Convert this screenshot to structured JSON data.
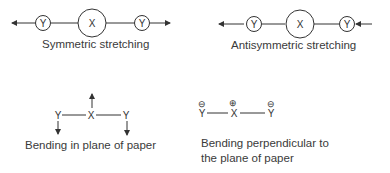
{
  "panels": {
    "symmetric": {
      "caption": "Symmetric stretching",
      "atoms": [
        "Y",
        "X",
        "Y"
      ]
    },
    "antisymmetric": {
      "caption": "Antisymmetric stretching",
      "atoms": [
        "Y",
        "X",
        "Y"
      ]
    },
    "bending_in_plane": {
      "caption": "Bending in plane of paper",
      "atoms": [
        "Y",
        "X",
        "Y"
      ]
    },
    "bending_perpendicular": {
      "caption_line1": "Bending perpendicular to",
      "caption_line2": "the plane of paper",
      "atoms": [
        "Y",
        "X",
        "Y"
      ],
      "charges": [
        "⊖",
        "⊕",
        "⊖"
      ]
    }
  }
}
